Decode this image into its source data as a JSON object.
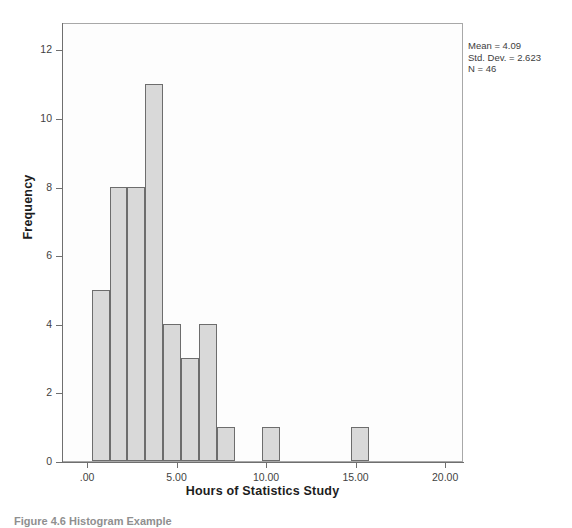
{
  "figure": {
    "caption": "Figure 4.6 Histogram Example"
  },
  "annotation": {
    "mean_label": "Mean = 4.09",
    "std_dev_label": "Std. Dev. = 2.623",
    "n_label": "N = 46"
  },
  "axes": {
    "x_title": "Hours of Statistics Study",
    "y_title": "Frequency",
    "x_tick_labels": [
      ".00",
      "5.00",
      "10.00",
      "15.00",
      "20.00"
    ],
    "y_tick_labels": [
      "0",
      "2",
      "4",
      "6",
      "8",
      "10",
      "12"
    ]
  },
  "colors": {
    "bar_fill": "#d9d9d9",
    "bar_border": "#6d6d6d",
    "axis": "#6f6f6f",
    "frame": "#a8a8a8",
    "plot_background": "#fdfdfd"
  },
  "chart_data": {
    "type": "bar",
    "title": "",
    "subtitle": "",
    "xlabel": "Hours of Statistics Study",
    "ylabel": "Frequency",
    "xlim": [
      -1.4,
      21.0
    ],
    "ylim": [
      0,
      12.8
    ],
    "xticks": [
      0,
      5,
      10,
      15,
      20
    ],
    "yticks": [
      0,
      2,
      4,
      6,
      8,
      10,
      12
    ],
    "grid": false,
    "legend": false,
    "bin_width": 1,
    "statistics": {
      "mean": 4.09,
      "std_dev": 2.623,
      "n": 46
    },
    "bins": [
      {
        "x_start": 0.2,
        "x_end": 1.2,
        "value": 5
      },
      {
        "x_start": 1.2,
        "x_end": 2.2,
        "value": 8
      },
      {
        "x_start": 2.2,
        "x_end": 3.2,
        "value": 8
      },
      {
        "x_start": 3.2,
        "x_end": 4.2,
        "value": 11
      },
      {
        "x_start": 4.2,
        "x_end": 5.2,
        "value": 4
      },
      {
        "x_start": 5.2,
        "x_end": 6.2,
        "value": 3
      },
      {
        "x_start": 6.2,
        "x_end": 7.2,
        "value": 4
      },
      {
        "x_start": 7.2,
        "x_end": 8.2,
        "value": 1
      },
      {
        "x_start": 9.7,
        "x_end": 10.7,
        "value": 1
      },
      {
        "x_start": 14.7,
        "x_end": 15.7,
        "value": 1
      }
    ],
    "categories": [
      "0.2-1.2",
      "1.2-2.2",
      "2.2-3.2",
      "3.2-4.2",
      "4.2-5.2",
      "5.2-6.2",
      "6.2-7.2",
      "7.2-8.2",
      "9.7-10.7",
      "14.7-15.7"
    ],
    "values": [
      5,
      8,
      8,
      11,
      4,
      3,
      4,
      1,
      1,
      1
    ]
  }
}
